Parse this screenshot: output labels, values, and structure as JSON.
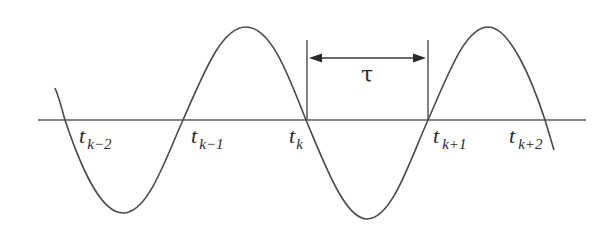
{
  "diagram": {
    "colors": {
      "line": "#4a4a4a",
      "background": "#ffffff",
      "text": "#2a2a2a"
    },
    "axis": {
      "x1": 38,
      "x2": 586,
      "y": 120
    },
    "interval": {
      "label": "τ",
      "left_x": 307,
      "right_x": 428,
      "top_y": 40,
      "arrow_y": 58
    },
    "zero_crossings": [
      {
        "id": "t_k-2",
        "base": "t",
        "subscript": "k−2",
        "x": 65
      },
      {
        "id": "t_k-1",
        "base": "t",
        "subscript": "k−1",
        "x": 183
      },
      {
        "id": "t_k",
        "base": "t",
        "subscript": "k",
        "x": 306
      },
      {
        "id": "t_k+1",
        "base": "t",
        "subscript": "k+1",
        "x": 428
      },
      {
        "id": "t_k+2",
        "base": "t",
        "subscript": "k+2",
        "x": 545
      }
    ]
  }
}
